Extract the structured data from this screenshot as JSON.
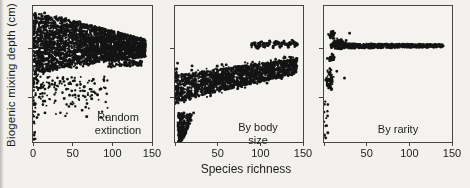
{
  "figure": {
    "background": "#f2f1ee",
    "ink_color": "#141414",
    "axis_color": "#474642",
    "text_color": "#1d1d1d"
  },
  "chart_data": {
    "type": "scatter",
    "title": "",
    "xlabel": "Species richness",
    "ylabel": "Biogenic mixing depth (cm)",
    "x_range": [
      0,
      150
    ],
    "y_axis_note": "no numeric y tick labels; depth given as normalized 0-1 of axis height",
    "grid": false,
    "legend": "none",
    "panel_geometry": {
      "left_px": [
        32,
        174,
        323
      ],
      "width_px": [
        119,
        128,
        128
      ],
      "top_px": 5,
      "height_px": 136
    },
    "y_tick_fracs_from_top": [
      0.31,
      0.67
    ],
    "panels": [
      {
        "name": "Random extinction",
        "label": "Random\nextinction",
        "label_pos": {
          "left": 85,
          "top": 105
        },
        "x_ticks": [
          0,
          50,
          100,
          150
        ],
        "x_tick_labels": [
          "0",
          "50",
          "100",
          "150"
        ],
        "clusters": [
          {
            "type": "wedge",
            "x": [
              0,
              142
            ],
            "top": [
              0.95,
              0.755,
              1.15
            ],
            "bot": [
              0.45,
              0.625,
              0.5
            ],
            "count": 2600
          },
          {
            "type": "wedge",
            "x": [
              0,
              112
            ],
            "top": [
              0.97,
              0.8,
              1.1
            ],
            "bot": [
              0.42,
              0.6,
              0.5
            ],
            "count": 260
          },
          {
            "type": "box",
            "x": [
              0,
              95
            ],
            "y": [
              0.12,
              0.48
            ],
            "x_pow": 1.6,
            "y_pow": 0.45,
            "count": 170
          },
          {
            "type": "box",
            "x": [
              0,
              3
            ],
            "y": [
              0.02,
              0.5
            ],
            "count": 22
          },
          {
            "type": "wedge",
            "x": [
              95,
              137
            ],
            "top": [
              0.61,
              0.6,
              1
            ],
            "bot": [
              0.55,
              0.56,
              1
            ],
            "count": 95
          },
          {
            "type": "points",
            "pts": [
              [
                2,
                0.07
              ],
              [
                5,
                0.18
              ],
              [
                3,
                0.28
              ],
              [
                8,
                0.33
              ],
              [
                13,
                0.3
              ],
              [
                1,
                0.02
              ]
            ]
          }
        ]
      },
      {
        "name": "By body size",
        "label": "By body size",
        "label_pos": {
          "left": 83,
          "top": 115
        },
        "x_ticks": [
          0,
          50,
          100,
          150
        ],
        "x_tick_labels": [
          "",
          "50",
          "100",
          "150"
        ],
        "clusters": [
          {
            "type": "wedge",
            "x": [
              0,
              143
            ],
            "top": [
              0.485,
              0.615,
              0.9
            ],
            "bot": [
              0.28,
              0.5,
              0.85
            ],
            "count": 1550
          },
          {
            "type": "wedge",
            "x": [
              0,
              143
            ],
            "top": [
              0.51,
              0.64,
              0.9
            ],
            "bot": [
              0.26,
              0.48,
              0.85
            ],
            "count": 130
          },
          {
            "type": "wedge",
            "x": [
              89,
              144
            ],
            "top": [
              0.732,
              0.742,
              1
            ],
            "bot": [
              0.696,
              0.706,
              1
            ],
            "wave": [
              0.01,
              9
            ],
            "count": 155
          },
          {
            "type": "teardrop",
            "y": [
              0.0,
              0.215
            ],
            "cx": [
              6,
              13
            ],
            "w": [
              5,
              20
            ],
            "count": 220
          },
          {
            "type": "box",
            "x": [
              0,
              3
            ],
            "y": [
              0.28,
              0.55
            ],
            "count": 24
          },
          {
            "type": "points",
            "pts": [
              [
                20,
                0.56
              ],
              [
                35,
                0.5
              ],
              [
                55,
                0.57
              ],
              [
                3,
                0.58
              ]
            ]
          }
        ]
      },
      {
        "name": "By rarity",
        "label": "By rarity",
        "label_pos": {
          "left": 74,
          "top": 117
        },
        "x_ticks": [
          0,
          50,
          100,
          150
        ],
        "x_tick_labels": [
          "",
          "50",
          "100",
          "150"
        ],
        "clusters": [
          {
            "type": "wedge",
            "x": [
              8,
              140
            ],
            "top": [
              0.725,
              0.718,
              1
            ],
            "bot": [
              0.688,
              0.697,
              1
            ],
            "count": 680
          },
          {
            "type": "blob",
            "cx": 18,
            "cy": 0.72,
            "rx": 10,
            "ry": 0.05,
            "count": 170
          },
          {
            "type": "blob",
            "cx": 9,
            "cy": 0.79,
            "rx": 5,
            "ry": 0.035,
            "count": 40
          },
          {
            "type": "blob",
            "cx": 9,
            "cy": 0.62,
            "rx": 7,
            "ry": 0.04,
            "count": 26
          },
          {
            "type": "blob",
            "cx": 7,
            "cy": 0.455,
            "rx": 5.5,
            "ry": 0.105,
            "count": 60
          },
          {
            "type": "box",
            "x": [
              0,
              6
            ],
            "y": [
              0.0,
              0.3
            ],
            "x_pow": 1.4,
            "count": 12
          },
          {
            "type": "points",
            "pts": [
              [
                24,
                0.47
              ],
              [
                15,
                0.52
              ],
              [
                3,
                0.12
              ],
              [
                2,
                0.03
              ],
              [
                30,
                0.8
              ]
            ]
          }
        ]
      }
    ]
  }
}
